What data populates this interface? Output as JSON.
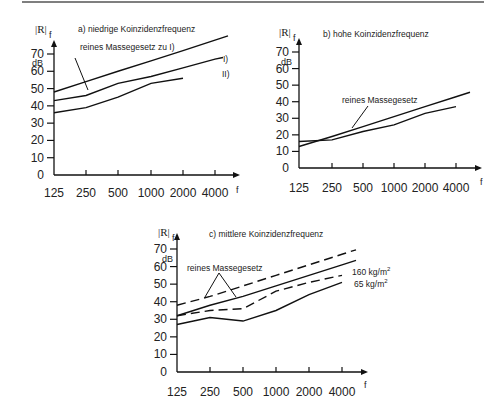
{
  "page": {
    "top_rule": true,
    "footer_caption": ""
  },
  "chart_data": [
    {
      "id": "a",
      "type": "line",
      "title": "a) niedrige Koinzidenzfrequenz",
      "xlabel": "f",
      "ylabel": "|R|_f",
      "yunit": "dB",
      "categories": [
        "125",
        "250",
        "500",
        "1000",
        "2000",
        "4000"
      ],
      "yticks": [
        "0",
        "10",
        "20",
        "30",
        "40",
        "50",
        "60",
        "70"
      ],
      "ylim": [
        0,
        70
      ],
      "grid": false,
      "annotation": "reines Massegesetz zu I)",
      "series": [
        {
          "name": "reines Massegesetz zu I)",
          "style": "solid",
          "values": [
            48,
            54,
            60,
            66,
            72,
            78
          ]
        },
        {
          "name": "I)",
          "style": "solid",
          "values": [
            43,
            46,
            53,
            57,
            62,
            67
          ]
        },
        {
          "name": "II)",
          "style": "solid",
          "values": [
            36,
            39,
            45,
            53,
            56
          ]
        }
      ],
      "series_labels": [
        "I)",
        "II)"
      ]
    },
    {
      "id": "b",
      "type": "line",
      "title": "b) hohe Koinzidenzfrequenz",
      "xlabel": "f",
      "ylabel": "|R|_f",
      "yunit": "dB",
      "categories": [
        "125",
        "250",
        "500",
        "1000",
        "2000",
        "4000"
      ],
      "yticks": [
        "0",
        "10",
        "20",
        "30",
        "40",
        "50",
        "60",
        "70"
      ],
      "ylim": [
        0,
        70
      ],
      "grid": false,
      "annotation": "reines Massegesetz",
      "series": [
        {
          "name": "reines Massegesetz",
          "style": "solid",
          "values": [
            13,
            19,
            25,
            31,
            37,
            43
          ]
        },
        {
          "name": "gemessen",
          "style": "solid",
          "values": [
            16,
            17,
            22,
            26,
            33,
            37
          ]
        }
      ]
    },
    {
      "id": "c",
      "type": "line",
      "title": "c) mittlere Koinzidenzfrequenz",
      "xlabel": "f",
      "ylabel": "|R|_f",
      "yunit": "dB",
      "categories": [
        "125",
        "250",
        "500",
        "1000",
        "2000",
        "4000"
      ],
      "yticks": [
        "0",
        "10",
        "20",
        "30",
        "40",
        "50",
        "60",
        "70"
      ],
      "ylim": [
        0,
        70
      ],
      "grid": false,
      "annotation": "reines Massegesetz",
      "series": [
        {
          "name": "reines Massegesetz 160 kg/m²",
          "style": "dashed",
          "values": [
            38,
            43,
            49,
            55,
            61,
            67
          ]
        },
        {
          "name": "reines Massegesetz 65 kg/m²",
          "style": "solid",
          "values": [
            32,
            38,
            43,
            49,
            55,
            61
          ]
        },
        {
          "name": "160 kg/m²",
          "style": "dashed",
          "values": [
            32,
            35,
            36,
            46,
            51,
            55
          ]
        },
        {
          "name": "65 kg/m²",
          "style": "solid",
          "values": [
            27,
            31,
            29,
            35,
            44,
            51
          ]
        }
      ],
      "series_labels": [
        "160 kg/m²",
        "65 kg/m²"
      ]
    }
  ],
  "labels": {
    "a": {
      "title": "a) niedrige Koinzidenzfrequenz",
      "annotation": "reines Massegesetz zu I)",
      "s1": "I)",
      "s2": "II)",
      "unit": "dB",
      "ylabel": "|R|",
      "ysub": "f",
      "xlabel": "f"
    },
    "b": {
      "title": "b) hohe Koinzidenzfrequenz",
      "annotation": "reines Massegesetz",
      "unit": "dB",
      "ylabel": "|R|",
      "ysub": "f",
      "xlabel": "f"
    },
    "c": {
      "title": "c) mittlere Koinzidenzfrequenz",
      "annotation": "reines Massegesetz",
      "s1": "160 kg/m",
      "s2": "65 kg/m",
      "sup": "2",
      "unit": "dB",
      "ylabel": "|R|",
      "ysub": "f",
      "xlabel": "f"
    }
  }
}
